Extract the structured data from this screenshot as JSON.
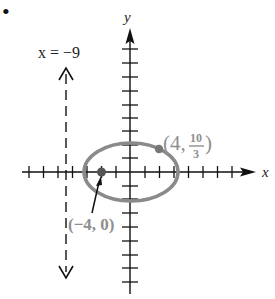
{
  "figure": {
    "bullet": "•",
    "axis_labels": {
      "x": "x",
      "y": "y"
    },
    "directrix": {
      "label": "x = −9",
      "x_value": -9,
      "style": "dashed"
    },
    "ellipse": {
      "focus_point": {
        "label": "(−4, 0)",
        "x": -4,
        "y": 0
      },
      "point_on_curve": {
        "label_prefix": "(4, ",
        "num": "10",
        "den": "3",
        "label_suffix": ")",
        "x": 4,
        "y": 3.333
      },
      "center_x": 0,
      "semi_major": 6,
      "semi_minor": 4.47
    },
    "tick_spacing_units": 2,
    "colors": {
      "axis": "#111111",
      "ellipse": "#8a8a8a",
      "label_gray": "#8f8f8f",
      "point": "#555555"
    }
  }
}
